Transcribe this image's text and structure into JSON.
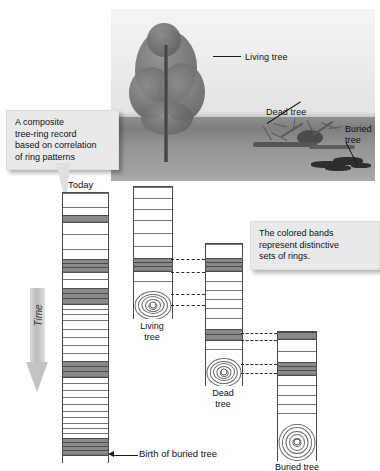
{
  "figure": {
    "domain": "diagram"
  },
  "photo": {
    "alt": "Grayscale landscape photograph showing a living tree, a fallen dead tree and a buried tree log",
    "labels": [
      {
        "id": "living-tree",
        "text": "Living tree"
      },
      {
        "id": "dead-tree",
        "text": "Dead tree"
      },
      {
        "id": "buried-tree",
        "text": "Buried\ntree",
        "line1": "Buried",
        "line2": "tree"
      }
    ]
  },
  "callouts": [
    {
      "id": "composite-record",
      "text": "A composite tree-ring record based on correlation of ring patterns",
      "lines": [
        "A composite",
        "tree-ring record",
        "based on correlation",
        "of ring patterns"
      ]
    },
    {
      "id": "colored-bands",
      "text": "The colored bands represent distinctive sets of rings.",
      "lines": [
        "The colored bands",
        "represent distinctive",
        "sets of rings."
      ]
    }
  ],
  "axis": {
    "time_label": "Time",
    "time_direction": "downward",
    "today_label": "Today",
    "birth_label": "Birth of buried tree"
  },
  "columns": [
    {
      "id": "composite",
      "label": "",
      "top_label": "Today",
      "has_pith": false,
      "note": "Composite master chronology assembled from the three overlapping samples"
    },
    {
      "id": "living-tree",
      "label": "Living tree",
      "label_lines": [
        "Living",
        "tree"
      ],
      "has_pith": true
    },
    {
      "id": "dead-tree",
      "label": "Dead tree",
      "label_lines": [
        "Dead",
        "tree"
      ],
      "has_pith": true
    },
    {
      "id": "buried-tree",
      "label": "Buried tree",
      "label_lines": [
        "Buried tree"
      ],
      "has_pith": true
    }
  ],
  "chart_data": {
    "type": "diagram",
    "title": "Composite tree-ring record based on correlation of ring patterns",
    "xlabel": "",
    "ylabel": "Time",
    "legend": [
      "Living tree",
      "Dead tree",
      "Buried tree",
      "Composite record"
    ],
    "annotations": [
      "Today",
      "Birth of buried tree",
      "The colored bands represent distinctive sets of rings."
    ],
    "series": [
      {
        "name": "composite",
        "x_px": 62,
        "width_px": 45,
        "y_top_px": 192,
        "y_bottom_px": 462,
        "rings_px": [
          {
            "y": 192,
            "h": 14,
            "type": "line"
          },
          {
            "y": 206,
            "h": 8,
            "type": "line"
          },
          {
            "y": 214,
            "h": 6,
            "type": "band"
          },
          {
            "y": 220,
            "h": 13,
            "type": "line"
          },
          {
            "y": 233,
            "h": 15,
            "type": "line"
          },
          {
            "y": 248,
            "h": 10,
            "type": "line"
          },
          {
            "y": 258,
            "h": 4,
            "type": "band"
          },
          {
            "y": 262,
            "h": 4,
            "type": "band"
          },
          {
            "y": 266,
            "h": 4,
            "type": "band"
          },
          {
            "y": 270,
            "h": 8,
            "type": "line"
          },
          {
            "y": 278,
            "h": 9,
            "type": "line"
          },
          {
            "y": 287,
            "h": 5,
            "type": "band"
          },
          {
            "y": 292,
            "h": 5,
            "type": "band"
          },
          {
            "y": 297,
            "h": 5,
            "type": "band"
          },
          {
            "y": 302,
            "h": 6,
            "type": "line"
          },
          {
            "y": 308,
            "h": 5,
            "type": "line"
          },
          {
            "y": 313,
            "h": 6,
            "type": "line"
          },
          {
            "y": 319,
            "h": 9,
            "type": "line"
          },
          {
            "y": 328,
            "h": 8,
            "type": "line"
          },
          {
            "y": 336,
            "h": 8,
            "type": "line"
          },
          {
            "y": 344,
            "h": 8,
            "type": "line"
          },
          {
            "y": 352,
            "h": 8,
            "type": "line"
          },
          {
            "y": 360,
            "h": 5,
            "type": "band"
          },
          {
            "y": 365,
            "h": 5,
            "type": "band"
          },
          {
            "y": 370,
            "h": 5,
            "type": "band"
          },
          {
            "y": 375,
            "h": 7,
            "type": "line"
          },
          {
            "y": 382,
            "h": 7,
            "type": "line"
          },
          {
            "y": 389,
            "h": 7,
            "type": "line"
          },
          {
            "y": 396,
            "h": 7,
            "type": "line"
          },
          {
            "y": 403,
            "h": 7,
            "type": "line"
          },
          {
            "y": 410,
            "h": 6,
            "type": "line"
          },
          {
            "y": 416,
            "h": 6,
            "type": "line"
          },
          {
            "y": 422,
            "h": 5,
            "type": "line"
          },
          {
            "y": 427,
            "h": 5,
            "type": "line"
          },
          {
            "y": 432,
            "h": 5,
            "type": "line"
          },
          {
            "y": 437,
            "h": 4,
            "type": "band"
          },
          {
            "y": 441,
            "h": 4,
            "type": "band"
          },
          {
            "y": 445,
            "h": 4,
            "type": "band"
          },
          {
            "y": 449,
            "h": 4,
            "type": "band"
          },
          {
            "y": 453,
            "h": 9,
            "type": "line"
          }
        ]
      },
      {
        "name": "living-tree",
        "x_px": 133,
        "width_px": 38,
        "y_top_px": 186,
        "y_bottom_px": 318,
        "rings_px": [
          {
            "y": 186,
            "h": 11,
            "type": "line"
          },
          {
            "y": 197,
            "h": 11,
            "type": "line"
          },
          {
            "y": 208,
            "h": 11,
            "type": "line"
          },
          {
            "y": 219,
            "h": 13,
            "type": "line"
          },
          {
            "y": 232,
            "h": 13,
            "type": "line"
          },
          {
            "y": 245,
            "h": 12,
            "type": "line"
          },
          {
            "y": 257,
            "h": 4,
            "type": "band"
          },
          {
            "y": 261,
            "h": 4,
            "type": "band"
          },
          {
            "y": 265,
            "h": 4,
            "type": "band"
          },
          {
            "y": 269,
            "h": 11,
            "type": "line"
          },
          {
            "y": 280,
            "h": 9,
            "type": "line"
          }
        ],
        "pith_y_px": 289,
        "pith_h_px": 29
      },
      {
        "name": "dead-tree",
        "x_px": 205,
        "width_px": 36,
        "y_top_px": 243,
        "y_bottom_px": 385,
        "rings_px": [
          {
            "y": 243,
            "h": 14,
            "type": "line"
          },
          {
            "y": 257,
            "h": 4,
            "type": "band"
          },
          {
            "y": 261,
            "h": 4,
            "type": "band"
          },
          {
            "y": 265,
            "h": 4,
            "type": "band"
          },
          {
            "y": 269,
            "h": 11,
            "type": "line"
          },
          {
            "y": 280,
            "h": 9,
            "type": "line"
          },
          {
            "y": 289,
            "h": 9,
            "type": "line"
          },
          {
            "y": 298,
            "h": 9,
            "type": "line"
          },
          {
            "y": 307,
            "h": 10,
            "type": "line"
          },
          {
            "y": 317,
            "h": 11,
            "type": "line"
          },
          {
            "y": 328,
            "h": 5,
            "type": "band"
          },
          {
            "y": 333,
            "h": 5,
            "type": "band"
          },
          {
            "y": 338,
            "h": 10,
            "type": "line"
          },
          {
            "y": 348,
            "h": 8,
            "type": "line"
          }
        ],
        "pith_y_px": 356,
        "pith_h_px": 29
      },
      {
        "name": "buried-tree",
        "x_px": 277,
        "width_px": 38,
        "y_top_px": 331,
        "y_bottom_px": 460,
        "rings_px": [
          {
            "y": 331,
            "h": 6,
            "type": "band"
          },
          {
            "y": 337,
            "h": 13,
            "type": "line"
          },
          {
            "y": 350,
            "h": 11,
            "type": "line"
          },
          {
            "y": 361,
            "h": 4,
            "type": "band"
          },
          {
            "y": 365,
            "h": 4,
            "type": "band"
          },
          {
            "y": 369,
            "h": 4,
            "type": "band"
          },
          {
            "y": 373,
            "h": 11,
            "type": "line"
          },
          {
            "y": 384,
            "h": 10,
            "type": "line"
          },
          {
            "y": 394,
            "h": 9,
            "type": "line"
          },
          {
            "y": 403,
            "h": 9,
            "type": "line"
          },
          {
            "y": 412,
            "h": 9,
            "type": "line"
          }
        ],
        "pith_y_px": 421,
        "pith_h_px": 39
      }
    ],
    "correlations": [
      {
        "from": "living-tree",
        "to": "dead-tree",
        "y_px": 259
      },
      {
        "from": "living-tree",
        "to": "dead-tree",
        "y_px": 272
      },
      {
        "from": "living-tree",
        "to": "dead-tree",
        "y_px": 294
      },
      {
        "from": "living-tree",
        "to": "dead-tree",
        "y_px": 305
      },
      {
        "from": "dead-tree",
        "to": "buried-tree",
        "y_px": 333
      },
      {
        "from": "dead-tree",
        "to": "buried-tree",
        "y_px": 340
      },
      {
        "from": "dead-tree",
        "to": "buried-tree",
        "y_px": 364
      },
      {
        "from": "dead-tree",
        "to": "buried-tree",
        "y_px": 373
      }
    ]
  },
  "colors": {
    "band": "#8a8a8a",
    "ring_line": "#777777",
    "column_edge": "#4a4a4a",
    "callout_bg": "#e9e9e9",
    "time_arrow": "#c6c6c6",
    "text": "#111111"
  }
}
